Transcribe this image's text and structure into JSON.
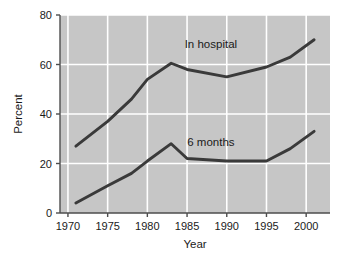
{
  "chart_data": {
    "type": "line",
    "title": "",
    "subtitle": "",
    "xlabel": "Year",
    "ylabel": "Percent",
    "xlim": [
      1969,
      2003
    ],
    "ylim": [
      0,
      80
    ],
    "xticks": [
      "1970",
      "1975",
      "1980",
      "1985",
      "1990",
      "1995",
      "2000"
    ],
    "xtick_values": [
      1970,
      1975,
      1980,
      1985,
      1990,
      1995,
      2000
    ],
    "yticks": [
      "0",
      "20",
      "40",
      "60",
      "80"
    ],
    "ytick_values": [
      0,
      20,
      40,
      60,
      80
    ],
    "grid": "white gridlines on gray panel, both axes at ticks",
    "legend": "inline annotations placed next to each line",
    "plot_background": "#c6c6c6",
    "gridline_color": "#ffffff",
    "axis_color": "#4d4d4d",
    "line_color": "#3a3a3a",
    "series": [
      {
        "name": "In hospital",
        "label": "In hospital",
        "color": "#3a3a3a",
        "annotation_x": 1988.0,
        "annotation_y": 66.5,
        "x": [
          1971,
          1975,
          1978,
          1980,
          1983,
          1985,
          1990,
          1995,
          1998,
          2001
        ],
        "values": [
          27,
          37,
          46,
          54,
          60.5,
          58,
          55,
          59,
          63,
          70
        ]
      },
      {
        "name": "6 months",
        "label": "6 months",
        "color": "#3a3a3a",
        "annotation_x": 1988.0,
        "annotation_y": 27.0,
        "x": [
          1971,
          1975,
          1978,
          1980,
          1983,
          1985,
          1990,
          1995,
          1998,
          2001
        ],
        "values": [
          4,
          11,
          16,
          21,
          28,
          22,
          21,
          21,
          26,
          33
        ]
      }
    ]
  },
  "figure": {
    "width": 345,
    "height": 260
  }
}
